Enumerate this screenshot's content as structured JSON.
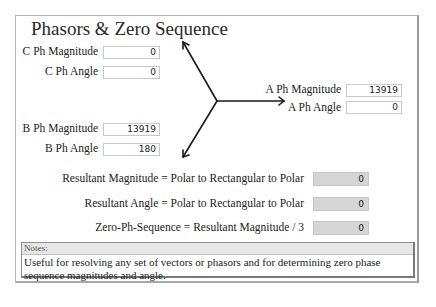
{
  "title": "Phasors & Zero Sequence",
  "inputs": {
    "c_mag": {
      "label": "C Ph Magnitude",
      "value": "0"
    },
    "c_ang": {
      "label": "C Ph Angle",
      "value": "0"
    },
    "a_mag": {
      "label": "A Ph Magnitude",
      "value": "13919"
    },
    "a_ang": {
      "label": "A Ph Angle",
      "value": "0"
    },
    "b_mag": {
      "label": "B Ph Magnitude",
      "value": "13919"
    },
    "b_ang": {
      "label": "B Ph Angle",
      "value": "180"
    }
  },
  "outputs": {
    "res_mag": {
      "label": "Resultant Magnitude = Polar to Rectangular to Polar",
      "value": "0"
    },
    "res_ang": {
      "label": "Resultant Angle = Polar to Rectangular to Polar",
      "value": "0"
    },
    "zero_seq": {
      "label": "Zero-Ph-Sequence = Resultant Magnitude / 3",
      "value": "0"
    }
  },
  "notes": {
    "header": "Notes:",
    "body": "Useful for resolving any set of vectors or phasors and for determining zero phase sequence magnitudes and angle."
  },
  "colors": {
    "output_bg": "#d5d5d5",
    "frame_border": "#b5b5b5"
  }
}
